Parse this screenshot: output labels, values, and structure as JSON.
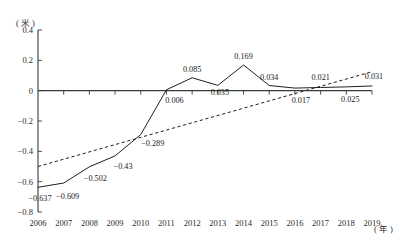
{
  "chart_data": {
    "type": "line",
    "title": "",
    "xlabel": "年",
    "ylabel": "米",
    "x_unit_label": "( 年 )",
    "y_unit_label": "( 米 )",
    "categories": [
      "2006",
      "2007",
      "2008",
      "2009",
      "2010",
      "2011",
      "2012",
      "2013",
      "2014",
      "2015",
      "2016",
      "2017",
      "2018",
      "2019"
    ],
    "xlim": [
      2006,
      2019
    ],
    "ylim": [
      -0.8,
      0.4
    ],
    "y_ticks": [
      0.4,
      0.2,
      0,
      -0.2,
      -0.4,
      -0.6,
      -0.8
    ],
    "y_tick_labels": [
      "0.4",
      "0.2",
      "0",
      "-0.2",
      "-0.4",
      "-0.6",
      "-0.8"
    ],
    "grid": false,
    "legend": "none",
    "series": [
      {
        "name": "观测值",
        "style": "solid",
        "values": [
          -0.637,
          -0.609,
          -0.502,
          -0.43,
          -0.289,
          0.006,
          0.085,
          0.035,
          0.169,
          0.034,
          0.017,
          0.021,
          0.025,
          0.031
        ],
        "data_labels": [
          "-0.637",
          "-0.609",
          "-0.502",
          "-0.43",
          "-0.289",
          "0.006",
          "0.085",
          "0.035",
          "0.169",
          "0.034",
          "0.017",
          "0.021",
          "0.025",
          "0.031"
        ]
      },
      {
        "name": "趋势线",
        "style": "dashed",
        "endpoints": [
          {
            "x": 2006,
            "y": -0.5
          },
          {
            "x": 2019,
            "y": 0.125
          }
        ]
      }
    ]
  },
  "labels": {
    "x_ticks": [
      "2006",
      "2007",
      "2008",
      "2009",
      "2010",
      "2011",
      "2012",
      "2013",
      "2014",
      "2015",
      "2016",
      "2017",
      "2018",
      "2019"
    ]
  },
  "colors": {
    "axis": "#3a3a3a",
    "series": "#1f1f1f",
    "trend": "#1f1f1f",
    "text": "#1a1a1a",
    "background": "#ffffff"
  }
}
